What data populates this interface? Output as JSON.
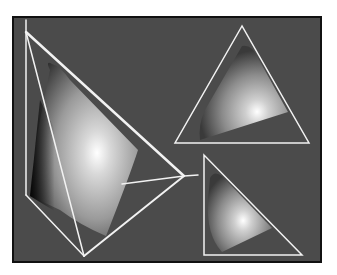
{
  "figure": {
    "colors": {
      "page_background": "#ffffff",
      "panel_background": "#4b4b4b",
      "panel_border": "#111111",
      "wireframe": "#f2f2f2"
    },
    "panel": {
      "x": 13,
      "y": 17,
      "width": 308,
      "height": 245
    },
    "tetrahedron": {
      "lines": [
        [
          26,
          20,
          26,
          195
        ],
        [
          26,
          32,
          84,
          256
        ],
        [
          26,
          32,
          184,
          176
        ],
        [
          26,
          195,
          84,
          256
        ],
        [
          84,
          256,
          184,
          176
        ],
        [
          122,
          184,
          184,
          176
        ],
        [
          184,
          176,
          198,
          175
        ]
      ]
    },
    "triangle_top_right": {
      "points": [
        [
          242,
          26
        ],
        [
          175,
          143
        ],
        [
          309,
          143
        ]
      ]
    },
    "triangle_bottom_right": {
      "points": [
        [
          204,
          155
        ],
        [
          204,
          255
        ],
        [
          302,
          255
        ]
      ]
    }
  }
}
